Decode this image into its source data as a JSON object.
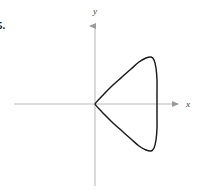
{
  "figure": {
    "problem_number": "5.",
    "background_color": "#ffffff",
    "axis_color": "#bcbcbc",
    "curve_color": "#1a1a1a",
    "label_color": "#3b3b3b",
    "x_axis_label": "x",
    "y_axis_label": "y"
  },
  "chart_data": {
    "type": "line",
    "title": "",
    "subtitle": "",
    "xlabel": "x",
    "ylabel": "y",
    "grid": false,
    "legend": false,
    "axes": {
      "origin_px": [
        95,
        104
      ],
      "x_axis_px": {
        "x1": 14,
        "y1": 104,
        "x2": 182,
        "y2": 104,
        "arrow": "right"
      },
      "y_axis_px": {
        "x1": 95,
        "y1": 22,
        "x2": 95,
        "y2": 186,
        "arrow": "up"
      },
      "x_tick_labels": [],
      "y_tick_labels": [],
      "xlim": [
        -1.8,
        2.1
      ],
      "ylim": [
        -1.75,
        1.75
      ]
    },
    "curve": {
      "name": "cardioid-like polar curve opening right",
      "description": "Closed curve with a cusp at the origin, symmetric about the x-axis, bulging to the right with a nearly flat vertical right edge",
      "cusp_point": [
        0,
        0
      ],
      "rightmost_point": [
        1.45,
        0
      ],
      "top_point": [
        0.95,
        1.0
      ],
      "bottom_point": [
        0.95,
        -1.0
      ],
      "points_px": [
        [
          95,
          104
        ],
        [
          104,
          94
        ],
        [
          113,
          85
        ],
        [
          122,
          77
        ],
        [
          131,
          69
        ],
        [
          139,
          62
        ],
        [
          146,
          58
        ],
        [
          151,
          57
        ],
        [
          154,
          60
        ],
        [
          156,
          68
        ],
        [
          157,
          80
        ],
        [
          157,
          92
        ],
        [
          157,
          104
        ],
        [
          157,
          116
        ],
        [
          157,
          128
        ],
        [
          156,
          140
        ],
        [
          154,
          148
        ],
        [
          151,
          151
        ],
        [
          146,
          150
        ],
        [
          139,
          146
        ],
        [
          131,
          139
        ],
        [
          122,
          131
        ],
        [
          113,
          123
        ],
        [
          104,
          114
        ],
        [
          95,
          104
        ]
      ]
    }
  }
}
